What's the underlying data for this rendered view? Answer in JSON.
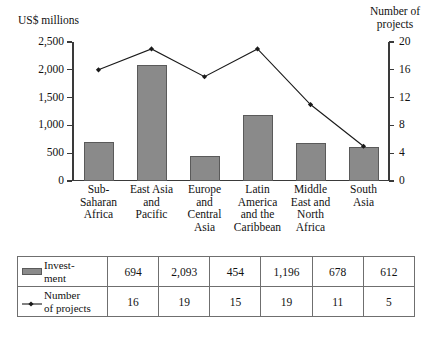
{
  "chart_data": {
    "type": "bar",
    "title": "",
    "subtitle": "",
    "categories": [
      "Sub-\nSaharan\nAfrica",
      "East Asia\nand\nPacific",
      "Europe\nand\nCentral\nAsia",
      "Latin\nAmerica\nand the\nCaribbean",
      "Middle\nEast and\nNorth\nAfrica",
      "South\nAsia"
    ],
    "series": [
      {
        "name": "Investment",
        "type": "bar",
        "axis": "left",
        "values": [
          694,
          2093,
          454,
          1196,
          678,
          612
        ],
        "value_labels": [
          "694",
          "2,093",
          "454",
          "1,196",
          "678",
          "612"
        ],
        "color": "#8a8a8a"
      },
      {
        "name": "Number of projects",
        "type": "line",
        "axis": "right",
        "values": [
          16,
          19,
          15,
          19,
          11,
          5
        ],
        "value_labels": [
          "16",
          "19",
          "15",
          "19",
          "11",
          "5"
        ],
        "color": "#1a1a1a"
      }
    ],
    "xlabel": "",
    "ylabel": "US$ millions",
    "y2label": "Number of projects",
    "ylim": [
      0,
      2500
    ],
    "y2lim": [
      0,
      20
    ],
    "yticks": [
      0,
      500,
      1000,
      1500,
      2000,
      2500
    ],
    "ytick_labels": [
      "0",
      "500",
      "1,000",
      "1,500",
      "2,000",
      "2,500"
    ],
    "y2ticks": [
      0,
      4,
      8,
      12,
      16,
      20
    ],
    "y2tick_labels": [
      "0",
      "4",
      "8",
      "12",
      "16",
      "20"
    ],
    "grid": false,
    "legend_position": "table-below"
  },
  "axes": {
    "left_title": "US$ millions",
    "right_title": "Number of\nprojects"
  },
  "table": {
    "rows": [
      {
        "legend_icon": "bar-swatch",
        "label": "Invest-\nment",
        "values": [
          "694",
          "2,093",
          "454",
          "1,196",
          "678",
          "612"
        ]
      },
      {
        "legend_icon": "line-marker",
        "label": "Number\nof projects",
        "values": [
          "16",
          "19",
          "15",
          "19",
          "11",
          "5"
        ]
      }
    ]
  }
}
